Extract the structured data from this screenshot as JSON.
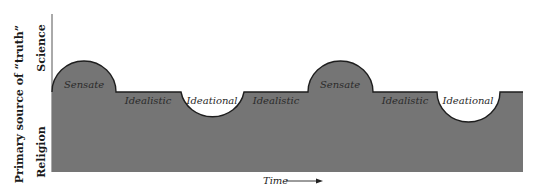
{
  "diagram": {
    "y_axis": {
      "title": "Primary source of “truth”",
      "top_label": "Science",
      "bottom_label": "Religion"
    },
    "x_axis": {
      "label": "Time",
      "arrow": "right-arrow"
    },
    "phases": [
      {
        "label": "Sensate",
        "shape": "bump"
      },
      {
        "label": "Idealistic",
        "shape": "flat"
      },
      {
        "label": "Ideational",
        "shape": "dip"
      },
      {
        "label": "Idealistic",
        "shape": "flat"
      },
      {
        "label": "Sensate",
        "shape": "bump"
      },
      {
        "label": "Idealistic",
        "shape": "flat"
      },
      {
        "label": "Ideational",
        "shape": "dip"
      }
    ],
    "colors": {
      "fill": "#757575",
      "outline": "#1e1e1e",
      "background": "#ffffff"
    }
  }
}
